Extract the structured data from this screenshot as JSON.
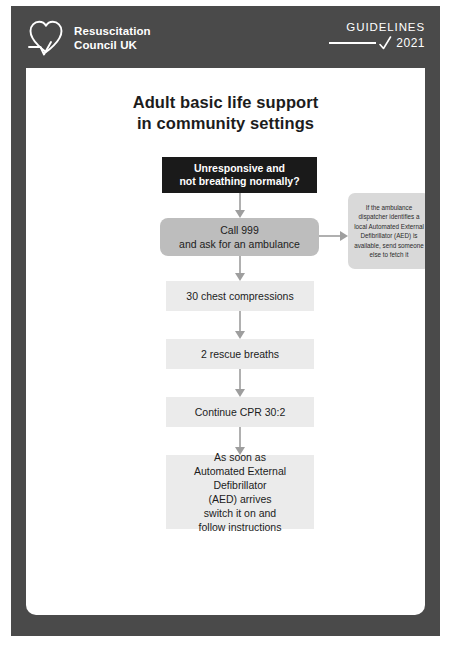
{
  "header": {
    "logo_icon": "heart-ecg-logo",
    "brand_name": "Resuscitation\nCouncil UK",
    "guidelines_label": "GUIDELINES",
    "guidelines_year": "2021",
    "tick_icon": "checkmark-icon"
  },
  "document": {
    "title": "Adult basic life support\nin community settings"
  },
  "flowchart": {
    "nodes": [
      {
        "id": "unresponsive",
        "text": "Unresponsive and\nnot breathing normally?",
        "style": "alert"
      },
      {
        "id": "call-999",
        "text": "Call 999\nand ask for an ambulance",
        "style": "emphasis"
      },
      {
        "id": "chest-compressions",
        "text": "30 chest compressions",
        "style": "standard"
      },
      {
        "id": "rescue-breaths",
        "text": "2 rescue breaths",
        "style": "standard"
      },
      {
        "id": "continue-cpr",
        "text": "Continue CPR 30:2",
        "style": "standard"
      },
      {
        "id": "aed-arrives",
        "text": "As soon as\nAutomated External Defibrillator\n(AED) arrives\nswitch it on and\nfollow instructions",
        "style": "standard"
      }
    ],
    "callout": {
      "id": "dispatcher-aed-note",
      "text": "If the ambulance dispatcher identifies a local Automated External Defibrillator (AED) is available, send someone else to fetch it"
    }
  },
  "colors": {
    "frame": "#4a4a4a",
    "alert_box": "#1a1a1a",
    "emphasis_box": "#bdbdbd",
    "standard_box": "#ebebeb",
    "callout_box": "#d9d9d9",
    "connector": "#9e9e9e",
    "text": "#1c1c1c",
    "inverse_text": "#ffffff"
  }
}
